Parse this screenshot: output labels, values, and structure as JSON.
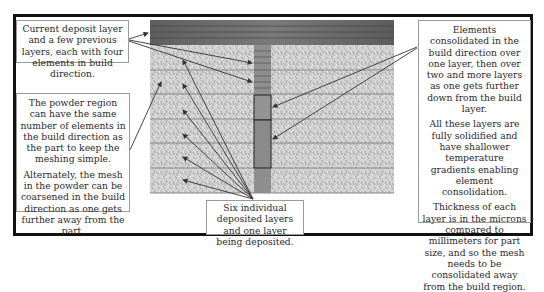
{
  "diagram": {
    "callouts": {
      "top_left": {
        "text": "Current deposit layer and a few previous layers, each with four elements in build direction."
      },
      "middle_left": {
        "paragraphs": [
          "The powder region can have the same number of elements in the build direction as the part to keep the meshing simple.",
          "Alternately, the mesh in the powder can be coarsened in the build direction as one gets further away from the part."
        ]
      },
      "right": {
        "paragraphs": [
          "Elements consolidated in the build direction over one layer, then over two and more layers as one gets further down from the build layer.",
          "All these layers are fully solidified and have shallower temperature gradients enabling element consolidation.",
          "Thickness of each layer is in the microns compared to millimeters for part size, and so the mesh needs to be consolidated away from the build region."
        ]
      },
      "bottom": {
        "text": "Six individual deposited layers and one layer being deposited."
      }
    },
    "regions": {
      "deposit_layer": {
        "label": "current-deposit-layer",
        "color": "#6d6d6d"
      },
      "powder": {
        "label": "powder-region",
        "color": "#c8c8c8",
        "layer_count": 6
      },
      "part": {
        "label": "part-column",
        "color": "#8e8e8e",
        "fine_layers": 4,
        "consolidated_blocks": 2
      }
    },
    "colors": {
      "frame": "#111111",
      "arrow": "#333333",
      "box_border": "#9a9a9a"
    }
  }
}
